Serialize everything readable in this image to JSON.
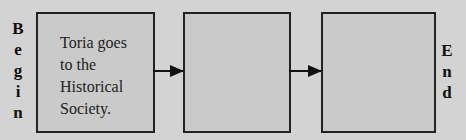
{
  "diagram": {
    "begin_label": [
      "B",
      "e",
      "g",
      "i",
      "n"
    ],
    "end_label": [
      "E",
      "n",
      "d"
    ],
    "boxes": [
      {
        "text_lines": [
          "Toria goes",
          "to the",
          "Historical",
          "Society."
        ]
      },
      {
        "text_lines": []
      },
      {
        "text_lines": []
      }
    ],
    "colors": {
      "background": "#d3d3d3",
      "box_fill": "#cacaca",
      "stroke": "#222222"
    }
  }
}
